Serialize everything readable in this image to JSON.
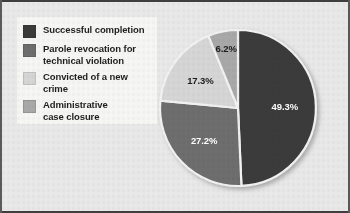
{
  "figure": {
    "background_color": "#e9e9e9",
    "frame_color": "#3e3e3e",
    "legend_panel_color": "#f6f6f4"
  },
  "legend": {
    "items": [
      {
        "label": "Successful completion",
        "color": "#3b3b3b",
        "swatch_name": "legend-swatch-successful-completion"
      },
      {
        "label": "Parole revocation for\ntechnical violation",
        "color": "#6e6e6e",
        "swatch_name": "legend-swatch-parole-revocation"
      },
      {
        "label": "Convicted of a new crime",
        "color": "#d6d6d6",
        "swatch_name": "legend-swatch-convicted-new-crime"
      },
      {
        "label": "Administrative\ncase closure",
        "color": "#a9a9a9",
        "swatch_name": "legend-swatch-administrative-closure"
      }
    ]
  },
  "chart_data": {
    "type": "pie",
    "title": "",
    "subtitle": "",
    "xlabel": "",
    "ylabel": "",
    "legend_position": "left",
    "grid": false,
    "start_angle_deg": 0,
    "direction": "clockwise",
    "categories": [
      "Successful completion",
      "Parole revocation for technical violation",
      "Convicted of a new crime",
      "Administrative case closure"
    ],
    "values": [
      49.3,
      27.2,
      17.3,
      6.2
    ],
    "value_labels": [
      "49.3%",
      "27.2%",
      "17.3%",
      "6.2%"
    ],
    "colors": [
      "#3b3b3b",
      "#6e6e6e",
      "#d6d6d6",
      "#a9a9a9"
    ],
    "label_text_colors": [
      "#ffffff",
      "#ffffff",
      "#1c1c1c",
      "#1c1c1c"
    ],
    "units": "percent",
    "total": 100.0,
    "slice_separator_color": "#f2f2f2"
  },
  "pie_labels": {
    "successful_completion": "49.3%",
    "parole_revocation": "27.2%",
    "convicted_new_crime": "17.3%",
    "administrative_closure": "6.2%"
  }
}
